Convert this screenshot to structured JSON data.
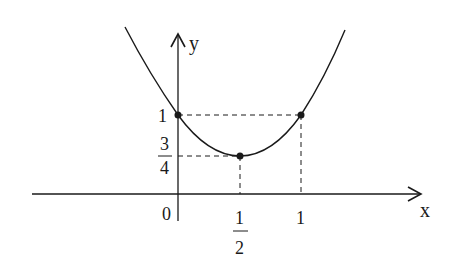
{
  "diagram": {
    "type": "parabola-graph",
    "function_description": "Parabola with vertex at (1/2, 3/4) passing through (0, 1) and (1, 1)",
    "axes": {
      "x_label": "x",
      "y_label": "y",
      "origin_label": "0"
    },
    "x_ticks": {
      "half_numerator": "1",
      "half_denominator": "2",
      "one": "1"
    },
    "y_ticks": {
      "one": "1",
      "three_quarters_numerator": "3",
      "three_quarters_denominator": "4"
    },
    "points": [
      {
        "name": "y-intercept",
        "x": "0",
        "y": "1"
      },
      {
        "name": "vertex",
        "x": "1/2",
        "y": "3/4"
      },
      {
        "name": "symmetric-point",
        "x": "1",
        "y": "1"
      }
    ],
    "colors": {
      "stroke": "#1a1a1a",
      "background": "#ffffff"
    }
  }
}
